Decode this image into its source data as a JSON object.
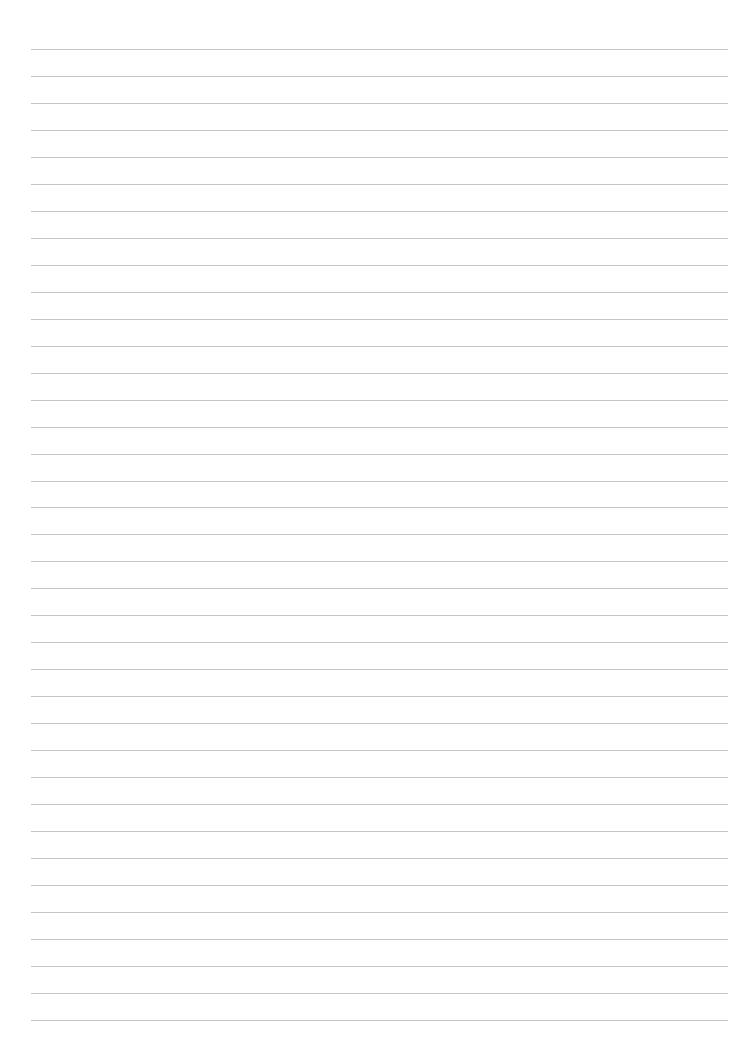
{
  "document": {
    "type": "ruled-paper",
    "line_count": 37,
    "line_color": "#c4c4c4",
    "background_color": "#ffffff",
    "content": []
  }
}
